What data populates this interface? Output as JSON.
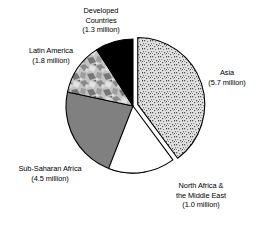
{
  "chart_data": {
    "type": "pie",
    "title": "",
    "unit": "million",
    "total": 14.3,
    "categories": [
      "Asia",
      "North Africa & the Middle East",
      "Sub-Saharan Africa",
      "Latin America",
      "Developed Countries"
    ],
    "values": [
      5.7,
      1.0,
      4.5,
      1.8,
      1.3
    ],
    "slices": [
      {
        "name": "Asia",
        "label_line1": "Asia",
        "label_line2": "(5.7 million)",
        "value": 5.7,
        "value_text": "5.7 million",
        "percent": 39.9,
        "start_angle": 0,
        "end_angle": 143.5,
        "fill": "speckle-fine",
        "color": "#d8d8d8",
        "exploded": true
      },
      {
        "name": "North Africa & the Middle East",
        "label_line1": "North Africa &",
        "label_line2": "the Middle East",
        "label_line3": "(1.0 million)",
        "value": 1.0,
        "value_text": "1.0 million",
        "percent": 7.0,
        "start_angle": 143.5,
        "end_angle": 168.7,
        "fill": "solid",
        "color": "#ffffff",
        "exploded": false
      },
      {
        "name": "Sub-Saharan Africa",
        "label_line1": "Sub-Saharan Africa",
        "label_line2": "(4.5 million)",
        "value": 4.5,
        "value_text": "4.5 million",
        "percent": 31.5,
        "start_angle": 168.7,
        "end_angle": 282.0,
        "fill": "solid",
        "color": "#808080",
        "exploded": false
      },
      {
        "name": "Latin America",
        "label_line1": "Latin America",
        "label_line2": "(1.8 million)",
        "value": 1.8,
        "value_text": "1.8 million",
        "percent": 12.6,
        "start_angle": 282.0,
        "end_angle": 327.3,
        "fill": "mottled",
        "color": "#bdbdbd",
        "exploded": false
      },
      {
        "name": "Developed Countries",
        "label_line1": "Developed",
        "label_line2": "Countries",
        "label_line3": "(1.3 million)",
        "value": 1.3,
        "value_text": "1.3 million",
        "percent": 9.1,
        "start_angle": 327.3,
        "end_angle": 360.0,
        "fill": "solid",
        "color": "#000000",
        "exploded": false
      }
    ],
    "legend_position": "callout-labels",
    "grid": false,
    "background": "#ffffff",
    "outline_color": "#000000"
  },
  "labels": {
    "developed": {
      "line1": "Developed",
      "line2": "Countries",
      "line3": "(1.3 million)"
    },
    "latin": {
      "line1": "Latin America",
      "line2": "(1.8 million)"
    },
    "asia": {
      "line1": "Asia",
      "line2": "(5.7 million)"
    },
    "ssa": {
      "line1": "Sub-Saharan Africa",
      "line2": "(4.5 million)"
    },
    "nafrica": {
      "line1": "North Africa &",
      "line2": "the Middle East",
      "line3": "(1.0 million)"
    }
  }
}
